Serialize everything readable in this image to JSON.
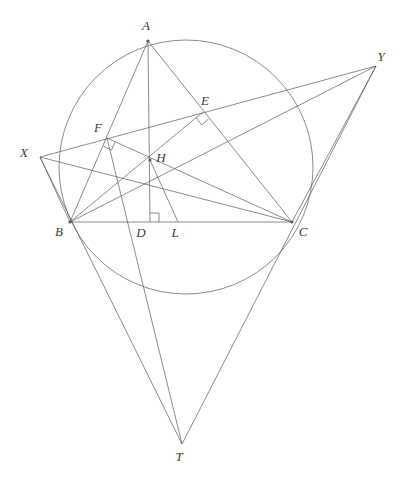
{
  "figure": {
    "width": 410,
    "height": 484,
    "background": "#ffffff",
    "stroke_color": "#5a5a5a",
    "label_color": "#3c3c3c",
    "stroke_width": 0.7
  },
  "points": {
    "A": {
      "label": "A",
      "x": 148,
      "y": 41,
      "lx": 146,
      "ly": 30,
      "dot": true
    },
    "B": {
      "label": "B",
      "x": 70,
      "y": 222,
      "lx": 59,
      "ly": 236,
      "dot": true
    },
    "C": {
      "label": "C",
      "x": 292,
      "y": 222,
      "lx": 303,
      "ly": 236,
      "dot": true
    },
    "D": {
      "label": "D",
      "x": 150,
      "y": 222,
      "lx": 141,
      "ly": 237,
      "dot": false
    },
    "L": {
      "label": "L",
      "x": 178,
      "y": 222,
      "lx": 175,
      "ly": 237,
      "dot": false
    },
    "E": {
      "label": "E",
      "x": 203,
      "y": 112,
      "lx": 205,
      "ly": 105,
      "dot": false
    },
    "F": {
      "label": "F",
      "x": 107,
      "y": 138,
      "lx": 98,
      "ly": 132,
      "dot": false
    },
    "H": {
      "label": "H",
      "x": 150,
      "y": 160,
      "lx": 161,
      "ly": 162,
      "dot": true
    },
    "X": {
      "label": "X",
      "x": 40,
      "y": 157,
      "lx": 24,
      "ly": 157,
      "dot": false
    },
    "Y": {
      "label": "Y",
      "x": 376,
      "y": 66,
      "lx": 381,
      "ly": 61,
      "dot": false
    },
    "T": {
      "label": "T",
      "x": 182,
      "y": 444,
      "lx": 179,
      "ly": 461,
      "dot": false
    }
  },
  "circle": {
    "name": "circumcircle",
    "cx": 186,
    "cy": 167,
    "r": 127
  },
  "segments": [
    {
      "name": "side-AB",
      "from": "A",
      "to": "B"
    },
    {
      "name": "side-BC",
      "from": "B",
      "to": "C"
    },
    {
      "name": "side-CA",
      "from": "C",
      "to": "A"
    },
    {
      "name": "altitude-AD",
      "from": "A",
      "to": "D"
    },
    {
      "name": "altitude-BE",
      "from": "B",
      "to": "E"
    },
    {
      "name": "altitude-CF",
      "from": "C",
      "to": "F"
    },
    {
      "name": "cevian-BY",
      "from": "B",
      "to": "Y"
    },
    {
      "name": "cevian-CX",
      "from": "C",
      "to": "X"
    },
    {
      "name": "segment-HL",
      "from": "H",
      "to": "L"
    },
    {
      "name": "segment-XB",
      "from": "X",
      "to": "B"
    },
    {
      "name": "segment-CY",
      "from": "C",
      "to": "Y"
    },
    {
      "name": "segment-XT",
      "from": "X",
      "to": "T"
    },
    {
      "name": "segment-YT",
      "from": "Y",
      "to": "T"
    },
    {
      "name": "segment-FT",
      "from": "F",
      "to": "T"
    }
  ],
  "line_XY": {
    "name": "line-XY",
    "from": "X",
    "to": "Y"
  },
  "right_angles": [
    {
      "name": "right-angle-at-D",
      "at": "D",
      "note": "AD perpendicular to BC"
    },
    {
      "name": "right-angle-at-E",
      "at": "E",
      "note": "BE perpendicular to AC"
    },
    {
      "name": "right-angle-at-F",
      "at": "F",
      "note": "CF perpendicular to AB"
    }
  ]
}
